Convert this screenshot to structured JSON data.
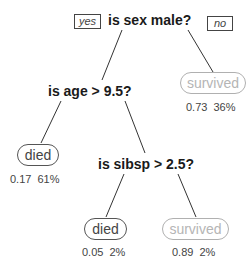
{
  "tree": {
    "root": {
      "question": "is sex male?",
      "yes_label": "yes",
      "no_label": "no"
    },
    "node_age": {
      "question": "is age > 9.5?"
    },
    "node_sibsp": {
      "question": "is sibsp > 2.5?"
    },
    "leaves": [
      {
        "id": "male-no-survived",
        "label": "survived",
        "prob": "0.73",
        "pct": "36%",
        "stat": "0.73  36%"
      },
      {
        "id": "age-yes-died",
        "label": "died",
        "prob": "0.17",
        "pct": "61%",
        "stat": "0.17  61%"
      },
      {
        "id": "sibsp-yes-died",
        "label": "died",
        "prob": "0.05",
        "pct": "2%",
        "stat": "0.05  2%"
      },
      {
        "id": "sibsp-no-survived",
        "label": "survived",
        "prob": "0.89",
        "pct": "2%",
        "stat": "0.89  2%"
      }
    ]
  },
  "colors": {
    "died": "#444444",
    "survived": "#b5b5b5",
    "edge": "#333333"
  }
}
